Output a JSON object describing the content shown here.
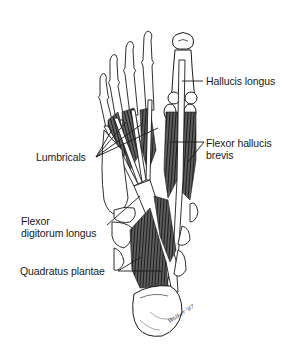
{
  "figure": {
    "labels": {
      "hallucis_longus": "Hallucis longus",
      "lumbricals": "Lumbricals",
      "flexor_hallucis_brevis": [
        "Flexor hallucis",
        "brevis"
      ],
      "flexor_digitorum_longus": [
        "Flexor",
        "digitorum longus"
      ],
      "quadratus_plantae": "Quadratus plantae"
    },
    "signature": "Walker '97",
    "colors": {
      "background": "#ffffff",
      "ink": "#1a1a1a",
      "muscle_shade": "#3a3a3a"
    }
  }
}
